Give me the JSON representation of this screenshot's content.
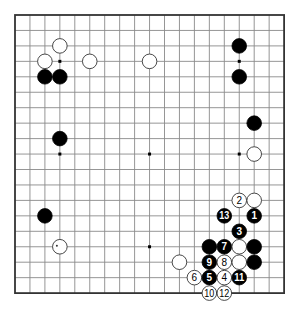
{
  "board": {
    "size": 19,
    "origin": {
      "x": 15,
      "y": 15
    },
    "spacing": {
      "x": 14.95,
      "y": 15.45
    },
    "stone_radius": 7.3,
    "colors": {
      "line": "#8a8a8a",
      "edge": "#333333",
      "black": "#000000",
      "white": "#ffffff"
    },
    "hoshi": [
      [
        3,
        3
      ],
      [
        9,
        3
      ],
      [
        15,
        3
      ],
      [
        3,
        9
      ],
      [
        9,
        9
      ],
      [
        15,
        9
      ],
      [
        3,
        15
      ],
      [
        9,
        15
      ],
      [
        15,
        15
      ]
    ],
    "stones": [
      {
        "color": "white",
        "col": 3,
        "row": 2,
        "label": ""
      },
      {
        "color": "white",
        "col": 2,
        "row": 3,
        "label": ""
      },
      {
        "color": "white",
        "col": 5,
        "row": 3,
        "label": ""
      },
      {
        "color": "white",
        "col": 9,
        "row": 3,
        "label": ""
      },
      {
        "color": "black",
        "col": 2,
        "row": 4,
        "label": ""
      },
      {
        "color": "black",
        "col": 3,
        "row": 4,
        "label": ""
      },
      {
        "color": "black",
        "col": 15,
        "row": 2,
        "label": ""
      },
      {
        "color": "black",
        "col": 15,
        "row": 4,
        "label": ""
      },
      {
        "color": "black",
        "col": 3,
        "row": 8,
        "label": ""
      },
      {
        "color": "black",
        "col": 16,
        "row": 7,
        "label": ""
      },
      {
        "color": "white",
        "col": 16,
        "row": 9,
        "label": ""
      },
      {
        "color": "black",
        "col": 2,
        "row": 13,
        "label": ""
      },
      {
        "color": "white",
        "col": 3,
        "row": 15,
        "label": "",
        "mark": "dot"
      },
      {
        "color": "white",
        "col": 15,
        "row": 12,
        "label": "2"
      },
      {
        "color": "white",
        "col": 16,
        "row": 12,
        "label": ""
      },
      {
        "color": "black",
        "col": 14,
        "row": 13,
        "label": "13"
      },
      {
        "color": "black",
        "col": 16,
        "row": 13,
        "label": "1"
      },
      {
        "color": "black",
        "col": 15,
        "row": 14,
        "label": "3"
      },
      {
        "color": "black",
        "col": 13,
        "row": 15,
        "label": ""
      },
      {
        "color": "black",
        "col": 14,
        "row": 15,
        "label": "7"
      },
      {
        "color": "white",
        "col": 15,
        "row": 15,
        "label": ""
      },
      {
        "color": "black",
        "col": 16,
        "row": 15,
        "label": ""
      },
      {
        "color": "white",
        "col": 11,
        "row": 16,
        "label": ""
      },
      {
        "color": "black",
        "col": 13,
        "row": 16,
        "label": "9"
      },
      {
        "color": "white",
        "col": 14,
        "row": 16,
        "label": "8"
      },
      {
        "color": "white",
        "col": 15,
        "row": 16,
        "label": ""
      },
      {
        "color": "black",
        "col": 16,
        "row": 16,
        "label": ""
      },
      {
        "color": "white",
        "col": 12,
        "row": 17,
        "label": "6"
      },
      {
        "color": "black",
        "col": 13,
        "row": 17,
        "label": "5"
      },
      {
        "color": "white",
        "col": 14,
        "row": 17,
        "label": "4"
      },
      {
        "color": "black",
        "col": 15,
        "row": 17,
        "label": "11"
      },
      {
        "color": "white",
        "col": 13,
        "row": 18,
        "label": "10"
      },
      {
        "color": "white",
        "col": 14,
        "row": 18,
        "label": "12"
      }
    ]
  }
}
